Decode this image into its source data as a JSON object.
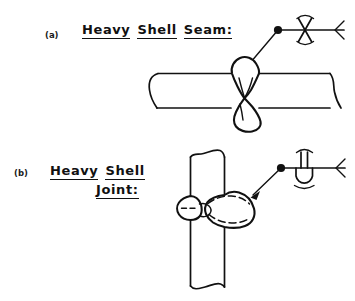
{
  "figure": {
    "title_semantic": "welding-symbol-application-examples",
    "background_color": "#ffffff",
    "line_color": "#111111",
    "parts": [
      {
        "tag": "(a)",
        "caption_words": [
          "Heavy",
          "Shell",
          "Seam:"
        ],
        "caption_lines": [
          [
            "Heavy",
            "Shell",
            "Seam:"
          ]
        ],
        "joint_type": "horizontal-shell-seam",
        "weld_symbol": {
          "name": "double-v-groove-convex-contour",
          "groove_glyph": "X",
          "contour_above": "convex-arc",
          "contour_below": "convex-arc",
          "has_arrow_tail": true,
          "has_leader_dot": true
        }
      },
      {
        "tag": "(b)",
        "caption_words": [
          "Heavy",
          "Shell",
          "Joint:"
        ],
        "caption_lines": [
          [
            "Heavy",
            "Shell"
          ],
          [
            "Joint:"
          ]
        ],
        "joint_type": "vertical-shell-joint",
        "weld_symbol": {
          "name": "square-groove-over-u-groove",
          "groove_glyph_above": "square-groove-double-vertical-lines",
          "groove_glyph_below": "u-groove",
          "contour_above": "convex-arc",
          "contour_below": "convex-arc",
          "has_arrow_tail": true,
          "has_leader_dot": true
        }
      }
    ]
  }
}
